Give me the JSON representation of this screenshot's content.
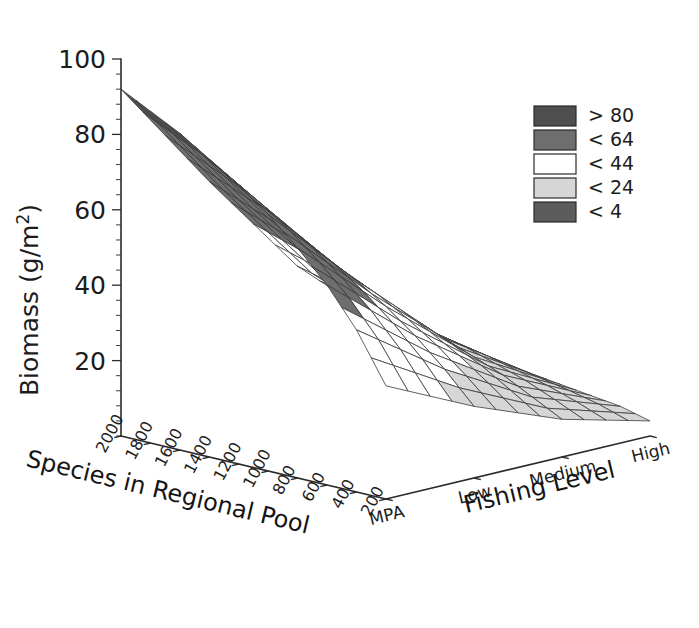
{
  "chart_data": {
    "type": "surface",
    "title": "",
    "subtitle": "",
    "zlabel": "Biomass (g/m2)",
    "zlabel_display": "Biomass (g/m",
    "zlabel_sup": "2",
    "zlabel_tail": ")",
    "xlabel": "Species in Regional Pool",
    "ylabel": "Fishing Level",
    "zlim": [
      0,
      100
    ],
    "z_ticks": [
      20,
      40,
      60,
      80,
      100
    ],
    "z_minor_count": 4,
    "grid": false,
    "x_categories": [
      "2000",
      "1800",
      "1600",
      "1400",
      "1200",
      "1000",
      "800",
      "600",
      "400",
      "200"
    ],
    "x_values": [
      2000,
      1800,
      1600,
      1400,
      1200,
      1000,
      800,
      600,
      400,
      200
    ],
    "y_categories": [
      "MPA",
      "Low",
      "Medium",
      "High"
    ],
    "legend": {
      "position": "top-right",
      "entries": [
        {
          "label": "> 80",
          "color": "#4f4f4f"
        },
        {
          "label": "< 64",
          "color": "#6e6e6e"
        },
        {
          "label": "< 44",
          "color": "#ffffff"
        },
        {
          "label": "< 24",
          "color": "#d6d6d6"
        },
        {
          "label": "< 4",
          "color": "#5c5c5c"
        }
      ]
    },
    "bands": [
      {
        "label": "> 80",
        "min": 80,
        "max": 100,
        "color": "#4f4f4f"
      },
      {
        "label": "< 64",
        "min": 44,
        "max": 80,
        "color": "#6e6e6e"
      },
      {
        "label": "< 44",
        "min": 24,
        "max": 44,
        "color": "#ffffff"
      },
      {
        "label": "< 24",
        "min": 4,
        "max": 24,
        "color": "#d6d6d6"
      },
      {
        "label": "< 4",
        "min": 0,
        "max": 4,
        "color": "#5c5c5c"
      }
    ],
    "z_matrix_rows": "y_categories (MPA, Low, Medium, High)",
    "z_matrix_cols": "x_values (2000 ... 200)",
    "z_matrix": [
      [
        92,
        88,
        84,
        79,
        74,
        68,
        61,
        53,
        43,
        30
      ],
      [
        62,
        59,
        56,
        53,
        49,
        45,
        40,
        34,
        27,
        19
      ],
      [
        34,
        32,
        30,
        28,
        26,
        24,
        21,
        18,
        14,
        10
      ],
      [
        13,
        12,
        12,
        11,
        10,
        9,
        8,
        7,
        6,
        4
      ]
    ]
  },
  "axes": {
    "z_axis_name": "Biomass (g/m2)",
    "x_axis_name": "Species in Regional Pool",
    "y_axis_name": "Fishing Level"
  }
}
